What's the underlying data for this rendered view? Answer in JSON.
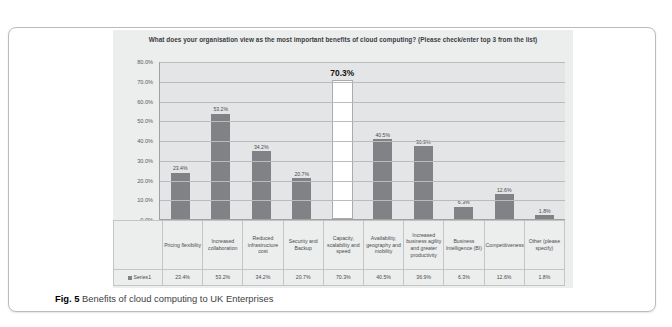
{
  "caption": {
    "label": "Fig. 5",
    "text": "Benefits of cloud computing to UK Enterprises"
  },
  "legend": {
    "series_name": "Series1"
  },
  "chart_data": {
    "type": "bar",
    "title": "What does your organisation view as the most important benefits of cloud computing? (Please check/enter top 3 from the list)",
    "xlabel": "",
    "ylabel": "",
    "ylim": [
      0,
      80
    ],
    "grid": true,
    "legend_position": "bottom-table",
    "highlight_category": "Capacity, scalability and speed",
    "categories": [
      "Pricing flexibility",
      "Increased collaboration",
      "Reduced infrastructure cost",
      "Security and Backup",
      "Capacity, scalability and speed",
      "Availability, geography and mobility",
      "Increased business agility and greater productivity",
      "Business Intelligence (BI)",
      "Competitiveness",
      "Other (please specify)"
    ],
    "values": [
      23.4,
      53.2,
      34.2,
      20.7,
      70.3,
      40.5,
      36.9,
      6.3,
      12.6,
      1.8
    ],
    "value_labels": [
      "23.4%",
      "53.2%",
      "34.2%",
      "20.7%",
      "70.3%",
      "40.5%",
      "36.9%",
      "6.3%",
      "12.6%",
      "1.8%"
    ],
    "ytick_labels": [
      "80.0%",
      "70.0%",
      "60.0%",
      "50.0%",
      "40.0%",
      "30.0%",
      "20.0%",
      "10.0%",
      "0.0%"
    ],
    "ytick_values": [
      80,
      70,
      60,
      50,
      40,
      30,
      20,
      10,
      0
    ],
    "series": [
      {
        "name": "Series1",
        "values": [
          23.4,
          53.2,
          34.2,
          20.7,
          70.3,
          40.5,
          36.9,
          6.3,
          12.6,
          1.8
        ]
      }
    ],
    "colors": {
      "bar": "#808285",
      "highlight_bar": "#ffffff",
      "plot_background": "#e4e5e6",
      "chart_background": "#eceded",
      "gridline": "#b9bbbd"
    }
  }
}
